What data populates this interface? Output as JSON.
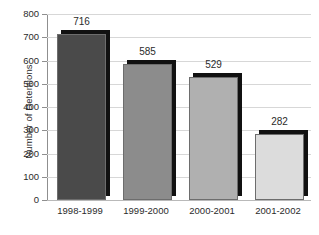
{
  "chart_data": {
    "type": "bar",
    "title": "",
    "xlabel": "",
    "ylabel": "Number of Detentions",
    "categories": [
      "1998-1999",
      "1999-2000",
      "2000-2001",
      "2001-2002"
    ],
    "values": [
      716,
      585,
      529,
      282
    ],
    "value_labels": [
      "716",
      "585",
      "529",
      "282"
    ],
    "ylim": [
      0,
      800
    ],
    "ytick_step": 100,
    "ytick_labels": [
      "800",
      "700",
      "600",
      "500",
      "400",
      "300",
      "200",
      "100",
      "0"
    ],
    "ytick_values": [
      800,
      700,
      600,
      500,
      400,
      300,
      200,
      100,
      0
    ],
    "grid": true,
    "grid_axis": "y",
    "legend": false,
    "legend_position": "none",
    "bar_colors": [
      "#4a4a4a",
      "#8c8c8c",
      "#b0b0b0",
      "#dcdcdc"
    ],
    "bar_shadow_color": "#111111",
    "bar_border_color": "#6d6d6d",
    "gridline_color": "#d7d7d7",
    "axis_color": "#8f8f8f",
    "background_color": "#ffffff",
    "text_color": "#2b2b2b"
  }
}
